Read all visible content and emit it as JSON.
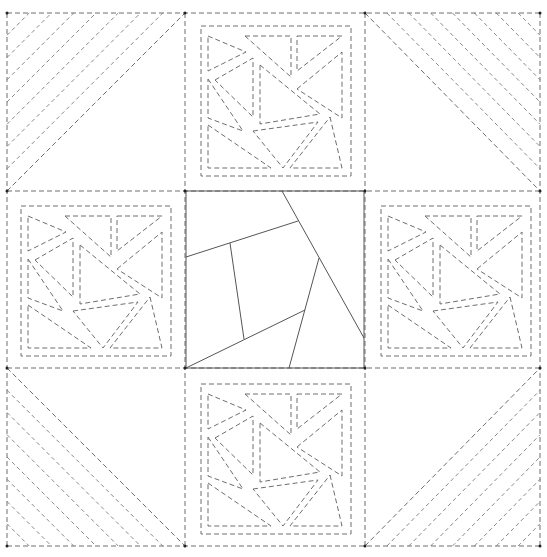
{
  "diagram": {
    "canvas": {
      "width": 547,
      "height": 557
    },
    "colors": {
      "background": "#ffffff",
      "stitch_line": "#6e6e6e",
      "echo_line": "#8a8a8a",
      "center_solid": "#555555",
      "corner_dot": "#222222"
    },
    "grid": {
      "xs": [
        7,
        185,
        365,
        540
      ],
      "ys": [
        13,
        191,
        368,
        546
      ]
    },
    "corners": [
      {
        "name": "top-left",
        "x": 7,
        "y": 13,
        "w": 178,
        "h": 178,
        "diagonal": "bl-tr",
        "fill_side": "top-left",
        "lines": 7
      },
      {
        "name": "top-right",
        "x": 365,
        "y": 13,
        "w": 175,
        "h": 178,
        "diagonal": "tl-br",
        "fill_side": "top-right",
        "lines": 7
      },
      {
        "name": "bottom-left",
        "x": 7,
        "y": 368,
        "w": 178,
        "h": 178,
        "diagonal": "tl-br",
        "fill_side": "bottom-left",
        "lines": 7
      },
      {
        "name": "bottom-right",
        "x": 365,
        "y": 368,
        "w": 175,
        "h": 178,
        "diagonal": "bl-tr",
        "fill_side": "bottom-right",
        "lines": 7
      }
    ],
    "center_block": {
      "x": 186,
      "y": 191,
      "w": 178,
      "h": 177,
      "lines": [
        [
          [
            282,
            191
          ],
          [
            364,
            338
          ]
        ],
        [
          [
            186,
            257
          ],
          [
            298,
            221
          ]
        ],
        [
          [
            230,
            243
          ],
          [
            244,
            339
          ]
        ],
        [
          [
            186,
            368
          ],
          [
            305,
            310
          ]
        ],
        [
          [
            319,
            258
          ],
          [
            289,
            368
          ]
        ]
      ]
    },
    "side_blocks": {
      "positions": [
        {
          "name": "top",
          "x": 185,
          "y": 10
        },
        {
          "name": "left",
          "x": 5,
          "y": 190
        },
        {
          "name": "right",
          "x": 365,
          "y": 190
        },
        {
          "name": "bottom",
          "x": 185,
          "y": 368
        }
      ],
      "frame": {
        "x": 16,
        "y": 16,
        "w": 150,
        "h": 150
      },
      "pieces": [
        [
          [
            23,
            26
          ],
          [
            61,
            42
          ],
          [
            23,
            61
          ]
        ],
        [
          [
            30,
            70
          ],
          [
            68,
            48
          ],
          [
            68,
            107
          ]
        ],
        [
          [
            60,
            26
          ],
          [
            106,
            26
          ],
          [
            106,
            67
          ]
        ],
        [
          [
            112,
            26
          ],
          [
            157,
            26
          ],
          [
            112,
            61
          ]
        ],
        [
          [
            112,
            79
          ],
          [
            157,
            42
          ],
          [
            157,
            108
          ]
        ],
        [
          [
            75,
            55
          ],
          [
            135,
            104
          ],
          [
            75,
            114
          ]
        ],
        [
          [
            23,
            69
          ],
          [
            58,
            121
          ],
          [
            23,
            108
          ]
        ],
        [
          [
            23,
            115
          ],
          [
            86,
            158
          ],
          [
            23,
            158
          ]
        ],
        [
          [
            68,
            121
          ],
          [
            133,
            112
          ],
          [
            98,
            158
          ]
        ],
        [
          [
            145,
            107
          ],
          [
            157,
            158
          ],
          [
            105,
            158
          ]
        ]
      ]
    }
  }
}
